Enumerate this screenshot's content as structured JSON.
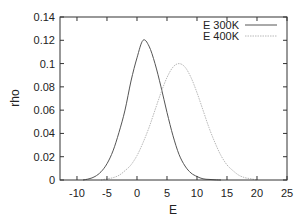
{
  "chart_data": {
    "type": "line",
    "title": "",
    "xlabel": "E",
    "ylabel": "rho",
    "xlim": [
      -12.83,
      25
    ],
    "ylim": [
      0,
      0.14
    ],
    "xticks": [
      -10,
      -5,
      0,
      5,
      10,
      15,
      20,
      25
    ],
    "xtick_labels": [
      "-10",
      "-5",
      "0",
      "5",
      "10",
      "15",
      "20",
      "25"
    ],
    "yticks": [
      0,
      0.02,
      0.04,
      0.06,
      0.08,
      0.1,
      0.12,
      0.14
    ],
    "ytick_labels": [
      "0",
      "0.02",
      "0.04",
      "0.06",
      "0.08",
      "0.1",
      "0.12",
      "0.14"
    ],
    "grid": false,
    "legend_position": "top-right",
    "series": [
      {
        "name": "E 300K",
        "color": "#555555",
        "style": "solid",
        "x": [
          -9,
          -8,
          -7,
          -6,
          -5,
          -4,
          -3,
          -2,
          -1,
          0,
          1,
          2,
          3,
          4,
          5,
          6,
          7,
          8,
          9,
          10,
          11,
          12,
          13,
          14
        ],
        "values": [
          0.0,
          0.001,
          0.003,
          0.007,
          0.014,
          0.025,
          0.041,
          0.06,
          0.085,
          0.105,
          0.12,
          0.115,
          0.1,
          0.08,
          0.058,
          0.038,
          0.022,
          0.012,
          0.006,
          0.003,
          0.001,
          0.0005,
          0.0002,
          0.0
        ]
      },
      {
        "name": "E 400K",
        "color": "#b8b8b8",
        "style": "dotted",
        "x": [
          -6,
          -5,
          -4,
          -3,
          -2,
          -1,
          0,
          1,
          2,
          3,
          4,
          5,
          6,
          7,
          8,
          9,
          10,
          11,
          12,
          13,
          14,
          15,
          16,
          17,
          18,
          19,
          20
        ],
        "values": [
          0.0,
          0.001,
          0.002,
          0.004,
          0.008,
          0.013,
          0.021,
          0.032,
          0.045,
          0.06,
          0.075,
          0.088,
          0.097,
          0.1,
          0.097,
          0.088,
          0.075,
          0.06,
          0.045,
          0.032,
          0.021,
          0.013,
          0.008,
          0.004,
          0.002,
          0.001,
          0.0
        ]
      }
    ]
  },
  "legend": {
    "items": [
      {
        "label": "E 300K",
        "color": "#555555"
      },
      {
        "label": "E 400K",
        "color": "#b8b8b8"
      }
    ]
  },
  "colors": {
    "frame": "#333333",
    "background": "#ffffff"
  }
}
